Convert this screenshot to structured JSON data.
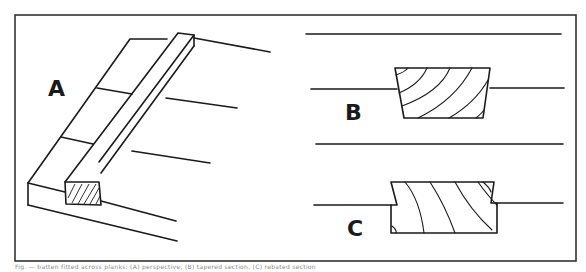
{
  "figure": {
    "panels": [
      {
        "id": "A",
        "label": "A",
        "description": "Perspective view of a batten laid over planks, with hatched cross-section"
      },
      {
        "id": "B",
        "label": "B",
        "description": "Tapered (trapezoidal) batten section with wood grain, set between lines"
      },
      {
        "id": "C",
        "label": "C",
        "description": "Rebated batten section with wood grain, set between lines"
      }
    ],
    "caption": "Fig. — batten fitted across planks: (A) perspective, (B) tapered section, (C) rebated section",
    "colors": {
      "line": "#1a1a1a",
      "background": "#ffffff",
      "border": "#333333"
    }
  }
}
